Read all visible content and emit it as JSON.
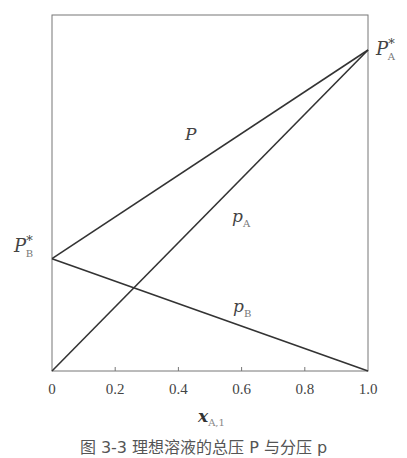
{
  "chart_data": {
    "type": "line",
    "title": "",
    "xlabel": "x",
    "xlabel_sub": "A,1",
    "ylabel": "",
    "xlim": [
      0,
      1.0
    ],
    "ylim": [
      0,
      1.1
    ],
    "x_ticks": [
      "0",
      "0.2",
      "0.4",
      "0.6",
      "0.8",
      "1.0"
    ],
    "x_tick_values": [
      0,
      0.2,
      0.4,
      0.6,
      0.8,
      1.0
    ],
    "grid": false,
    "series": [
      {
        "name": "P",
        "label": "P",
        "x": [
          0,
          1.0
        ],
        "y": [
          0.35,
          1.0
        ]
      },
      {
        "name": "p_A",
        "label": "p",
        "label_sub": "A",
        "x": [
          0,
          1.0
        ],
        "y": [
          0,
          1.0
        ]
      },
      {
        "name": "p_B",
        "label": "p",
        "label_sub": "B",
        "x": [
          0,
          1.0
        ],
        "y": [
          0.35,
          0
        ]
      }
    ],
    "annotations": [
      {
        "text": "P",
        "sub": "A",
        "sup": "*",
        "at": "right end, x=1.0"
      },
      {
        "text": "P",
        "sub": "B",
        "sup": "*",
        "at": "left end, x=0"
      }
    ]
  },
  "caption": "图 3-3  理想溶液的总压 P 与分压 p"
}
